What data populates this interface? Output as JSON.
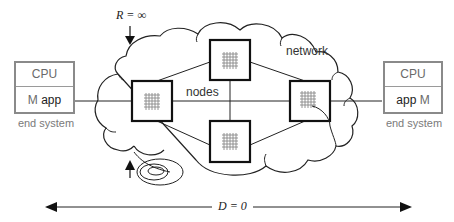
{
  "diagram": {
    "title_annotations": {
      "resistance": "R = ∞",
      "distance": "D = 0"
    },
    "network_label": "network",
    "nodes_label": "nodes",
    "end_systems": [
      {
        "id": "left",
        "cpu_label": "CPU",
        "m_label": "M",
        "app_label": "app",
        "caption": "end system"
      },
      {
        "id": "right",
        "cpu_label": "CPU",
        "m_label": "M",
        "app_label": "app",
        "caption": "end system"
      }
    ],
    "nodes": [
      {
        "id": "left-node",
        "x": 132,
        "y": 81,
        "w": 40,
        "h": 40
      },
      {
        "id": "top-node",
        "x": 210,
        "y": 40,
        "w": 40,
        "h": 40
      },
      {
        "id": "bottom-node",
        "x": 210,
        "y": 121,
        "w": 40,
        "h": 41
      },
      {
        "id": "right-node",
        "x": 290,
        "y": 81,
        "w": 40,
        "h": 40
      }
    ],
    "colors": {
      "line": "#222222",
      "end_system_border": "#8a8a8a",
      "end_system_text": "#6a6a6a",
      "node_grid": "#888888"
    }
  }
}
